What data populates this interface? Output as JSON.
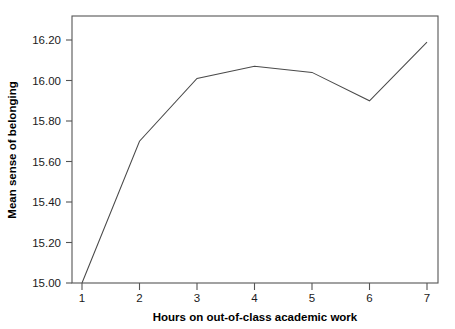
{
  "chart_data": {
    "type": "line",
    "title": "",
    "xlabel": "Hours on out-of-class academic work",
    "ylabel": "Mean sense of belonging",
    "x": [
      1,
      2,
      3,
      4,
      5,
      6,
      7
    ],
    "values": [
      15.0,
      15.7,
      16.01,
      16.07,
      16.04,
      15.9,
      16.19
    ],
    "series": [
      {
        "name": "Mean sense of belonging",
        "values": [
          15.0,
          15.7,
          16.01,
          16.07,
          16.04,
          15.9,
          16.19
        ]
      }
    ],
    "xtick_labels": [
      "1",
      "2",
      "3",
      "4",
      "5",
      "6",
      "7"
    ],
    "ytick_labels": [
      "15.00",
      "15.20",
      "15.40",
      "15.60",
      "15.80",
      "16.00",
      "16.20"
    ],
    "ytick_values": [
      15.0,
      15.2,
      15.4,
      15.6,
      15.8,
      16.0,
      16.2
    ],
    "xlim": [
      0.55,
      7.55
    ],
    "ylim": [
      15.0,
      16.28
    ],
    "grid": false,
    "legend": false,
    "legend_position": "none",
    "line_color": "#4a4a4a",
    "axis_color": "#555555",
    "text_color": "#1a1a1a",
    "background_color": "#ffffff"
  },
  "axes": {
    "x_title": "Hours on out-of-class academic work",
    "y_title": "Mean sense of belonging"
  },
  "ticks": {
    "y": {
      "t0": "15.00",
      "t1": "15.20",
      "t2": "15.40",
      "t3": "15.60",
      "t4": "15.80",
      "t5": "16.00",
      "t6": "16.20"
    },
    "x": {
      "t0": "1",
      "t1": "2",
      "t2": "3",
      "t3": "4",
      "t4": "5",
      "t5": "6",
      "t6": "7"
    }
  }
}
